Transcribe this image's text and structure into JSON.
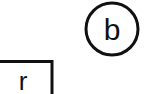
{
  "diagram": {
    "background_color": "#ffffff",
    "stroke_color": "#101010",
    "text_color": "#101010",
    "stroke_width": 3,
    "canvas": {
      "width": 147,
      "height": 94
    },
    "shapes": [
      {
        "id": "circle-node-b",
        "type": "circle",
        "label": "b",
        "cx": 112,
        "cy": 29,
        "r": 26,
        "label_x": 112,
        "label_y": 40,
        "font_size": 30,
        "clipped": false
      },
      {
        "id": "rect-node-r",
        "type": "rectangle",
        "label": "r",
        "x": -14,
        "y": 60,
        "width": 66,
        "height": 48,
        "label_x": 23,
        "label_y": 90,
        "font_size": 26,
        "clipped": true,
        "clipped_edges": [
          "left",
          "bottom"
        ]
      }
    ]
  }
}
